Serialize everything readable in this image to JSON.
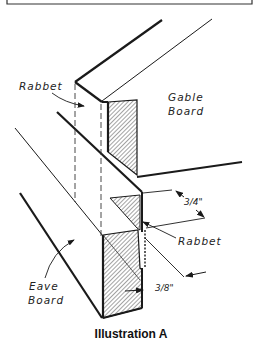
{
  "diagram": {
    "caption": "Illustration A",
    "labels": {
      "rabbet_top": "Rabbet",
      "gable_line1": "Gable",
      "gable_line2": "Board",
      "eave_line1": "Eave",
      "eave_line2": "Board",
      "rabbet_side": "Rabbet"
    },
    "dimensions": {
      "depth": "3/4\"",
      "width": "3/8\""
    },
    "colors": {
      "line": "#1a1a1a",
      "hatch": "#333333",
      "background": "#ffffff"
    }
  }
}
